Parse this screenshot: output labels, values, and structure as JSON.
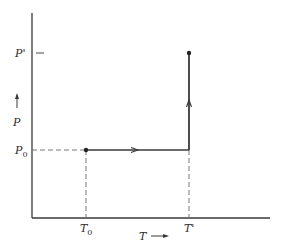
{
  "diagram": {
    "type": "P-T path diagram",
    "colors": {
      "line": "#3a3a3a",
      "dashed": "#6a6a6a",
      "background": "#ffffff"
    },
    "axes": {
      "x_label": "T",
      "y_label": "P",
      "x_arrow": "→",
      "y_arrow": "↑"
    },
    "ticks": {
      "x": [
        {
          "base": "T",
          "sub": "0",
          "prime": ""
        },
        {
          "base": "T",
          "sub": "",
          "prime": "'"
        }
      ],
      "y": [
        {
          "base": "P",
          "sub": "0",
          "prime": ""
        },
        {
          "base": "P",
          "sub": "",
          "prime": "'"
        }
      ]
    },
    "path": {
      "points": [
        {
          "label": "start",
          "T": "T0",
          "P": "P0"
        },
        {
          "label": "corner",
          "T": "T'",
          "P": "P0"
        },
        {
          "label": "end",
          "T": "T'",
          "P": "P'"
        }
      ],
      "segments": [
        {
          "from": "start",
          "to": "corner",
          "direction": "right",
          "description": "isobaric heating at P0 from T0 to T'"
        },
        {
          "from": "corner",
          "to": "end",
          "direction": "up",
          "description": "isothermal compression at T' from P0 to P'"
        }
      ]
    }
  }
}
